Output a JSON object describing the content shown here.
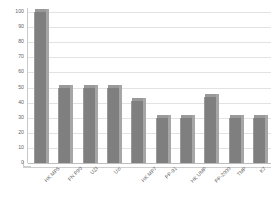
{
  "chart_data": {
    "type": "bar",
    "title": "",
    "subtitle": "",
    "xlabel": "",
    "ylabel": "",
    "ylim": [
      0,
      100
    ],
    "ytick_step": 10,
    "yticks": [
      "100",
      "90",
      "80",
      "70",
      "60",
      "50",
      "40",
      "30",
      "20",
      "10",
      "0"
    ],
    "grid": true,
    "legend": false,
    "legend_position": "none",
    "categories": [
      "HK MP5",
      "FN P90",
      "UZI",
      "Uzi",
      "HK MP7",
      "PP-91",
      "HK UMP",
      "PP-2000",
      "TMP",
      "K7"
    ],
    "values": [
      100,
      50,
      50,
      50,
      41,
      30,
      30,
      44,
      30,
      30
    ],
    "series": [
      {
        "name": "Series 1",
        "values": [
          100,
          50,
          50,
          50,
          41,
          30,
          30,
          44,
          30,
          30
        ]
      }
    ],
    "annotations": [],
    "colors": {
      "bar_fill": "#7f7f7f",
      "bar_side": "#a6a6a6",
      "bar_top": "#999999",
      "gridline": "#e3e3e3",
      "axis": "#c9c9c9",
      "text": "#666666",
      "background": "#ffffff"
    }
  }
}
